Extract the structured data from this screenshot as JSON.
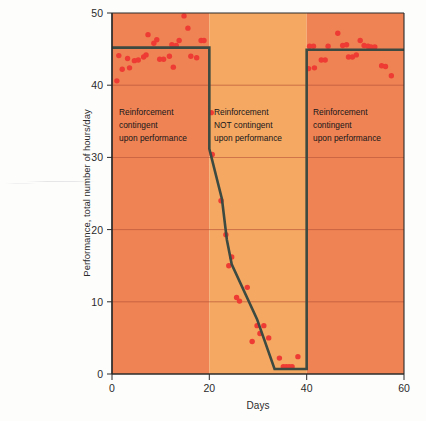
{
  "chart_data": {
    "type": "scatter",
    "title": "",
    "xlabel": "Days",
    "ylabel": "Performance, total number of hours/day",
    "xlim": [
      0,
      60
    ],
    "ylim": [
      0,
      50
    ],
    "xticks": [
      0,
      20,
      40,
      60
    ],
    "yticks": [
      0,
      10,
      20,
      30,
      40,
      50
    ],
    "grid": true,
    "legend": "none",
    "phases": [
      {
        "id": "phase-1",
        "label_lines": [
          "Reinforcement",
          "contingent",
          "upon performance"
        ],
        "x_start": 0,
        "x_end": 20,
        "background_color": "#ef8354"
      },
      {
        "id": "phase-2",
        "label_lines": [
          "Reinforcement",
          "NOT contingent",
          "upon performance"
        ],
        "x_start": 20,
        "x_end": 40,
        "background_color": "#f5a862"
      },
      {
        "id": "phase-3",
        "label_lines": [
          "Reinforcement",
          "contingent",
          "upon performance"
        ],
        "x_start": 40,
        "x_end": 60,
        "background_color": "#ef8354"
      }
    ],
    "series": [
      {
        "name": "Daily performance observations",
        "type": "scatter",
        "marker_color": "#ee3b33",
        "points": [
          [
            1.0,
            40.6
          ],
          [
            1.4,
            44.1
          ],
          [
            2.1,
            42.2
          ],
          [
            3.2,
            43.7
          ],
          [
            3.6,
            42.4
          ],
          [
            4.6,
            43.4
          ],
          [
            5.4,
            43.5
          ],
          [
            6.5,
            43.9
          ],
          [
            7.0,
            44.2
          ],
          [
            7.4,
            47.0
          ],
          [
            8.6,
            45.8
          ],
          [
            9.2,
            46.3
          ],
          [
            9.8,
            43.6
          ],
          [
            10.6,
            43.6
          ],
          [
            11.8,
            44.0
          ],
          [
            12.3,
            45.6
          ],
          [
            12.6,
            42.5
          ],
          [
            13.2,
            45.5
          ],
          [
            13.8,
            46.2
          ],
          [
            14.8,
            49.6
          ],
          [
            15.6,
            47.9
          ],
          [
            16.2,
            44.0
          ],
          [
            17.4,
            43.8
          ],
          [
            18.3,
            46.2
          ],
          [
            18.9,
            46.2
          ],
          [
            20.4,
            36.2
          ],
          [
            20.6,
            30.4
          ],
          [
            22.4,
            24.0
          ],
          [
            23.4,
            19.3
          ],
          [
            24.0,
            15.0
          ],
          [
            24.6,
            16.2
          ],
          [
            25.6,
            10.6
          ],
          [
            26.2,
            10.1
          ],
          [
            27.8,
            12.0
          ],
          [
            28.8,
            4.5
          ],
          [
            29.8,
            6.7
          ],
          [
            30.4,
            5.6
          ],
          [
            31.2,
            6.7
          ],
          [
            32.2,
            5.0
          ],
          [
            34.4,
            2.2
          ],
          [
            35.2,
            1.0
          ],
          [
            35.8,
            1.0
          ],
          [
            36.4,
            1.0
          ],
          [
            37.0,
            1.0
          ],
          [
            38.2,
            2.4
          ],
          [
            40.4,
            42.3
          ],
          [
            40.6,
            45.4
          ],
          [
            41.4,
            45.4
          ],
          [
            41.6,
            42.4
          ],
          [
            43.0,
            43.5
          ],
          [
            43.8,
            43.5
          ],
          [
            44.4,
            45.4
          ],
          [
            46.4,
            47.2
          ],
          [
            47.4,
            45.5
          ],
          [
            48.2,
            45.6
          ],
          [
            48.6,
            43.9
          ],
          [
            49.4,
            43.9
          ],
          [
            50.2,
            44.2
          ],
          [
            51.0,
            46.2
          ],
          [
            51.8,
            45.5
          ],
          [
            52.6,
            45.4
          ],
          [
            53.2,
            45.3
          ],
          [
            54.0,
            45.3
          ],
          [
            55.4,
            42.7
          ],
          [
            56.2,
            42.6
          ],
          [
            57.4,
            41.3
          ]
        ]
      },
      {
        "name": "Trend line",
        "type": "line",
        "line_color": "#3c4a42",
        "vertices": [
          [
            0.0,
            45.2
          ],
          [
            20.0,
            45.2
          ],
          [
            20.0,
            31.2
          ],
          [
            22.6,
            24.2
          ],
          [
            23.6,
            18.6
          ],
          [
            24.6,
            15.2
          ],
          [
            29.8,
            7.6
          ],
          [
            33.4,
            0.7
          ],
          [
            40.0,
            0.7
          ],
          [
            40.0,
            44.9
          ],
          [
            60.0,
            44.9
          ]
        ]
      }
    ]
  },
  "plot": {
    "background_outer": "#fdfdfc",
    "grid_color": "#b8553a",
    "axis_color": "#2b2b2b"
  }
}
